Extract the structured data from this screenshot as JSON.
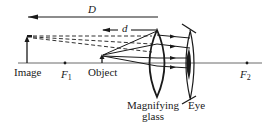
{
  "diagram": {
    "labels": {
      "distance_D": "D",
      "distance_d": "d",
      "image": "Image",
      "focal_point_1": "F",
      "focal_point_1_sub": "1",
      "object": "Object",
      "lens_line1": "Magnifying",
      "lens_line2": "glass",
      "eye": "Eye",
      "focal_point_2": "F",
      "focal_point_2_sub": "2"
    },
    "colors": {
      "ink": "#1a1a1a",
      "axis": "#6b6b6b",
      "background": "#ffffff"
    }
  }
}
